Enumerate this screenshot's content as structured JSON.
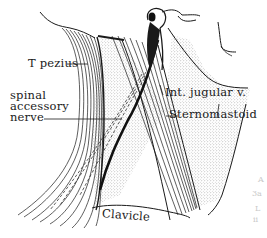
{
  "figure": {
    "labels": {
      "trapezius": "T  pezius",
      "spinal_accessory_line1": "spinal",
      "spinal_accessory_line2": "accessory",
      "spinal_accessory_line3": "nerve",
      "int_jugular": "Int. jugular v.",
      "sternomastoid": "Sternomastoid",
      "clavicle": "Clavicle"
    },
    "margin_marks": [
      "A",
      "3a",
      "L",
      "ii"
    ],
    "colors": {
      "ink": "#1a1a1a",
      "stipple": "#9a9a9a",
      "background": "#ffffff",
      "faint": "#c9c9c9"
    }
  }
}
